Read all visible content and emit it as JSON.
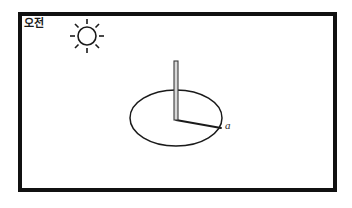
{
  "figure": {
    "title_label": "오전",
    "shadow_label": "a",
    "background_color": "#ffffff",
    "frame": {
      "name": "outer-frame",
      "color": "#111111",
      "stroke_width": 4,
      "x": 20,
      "y": 14,
      "width": 315,
      "height": 176
    },
    "sun": {
      "name": "sun-icon",
      "center_x": 87,
      "center_y": 36,
      "radius": 9,
      "ray_count": 8,
      "ray_inner": 12,
      "ray_outer": 17,
      "color": "#1a1a1a"
    },
    "sundial": {
      "name": "sundial-dial",
      "ellipse_cx": 176,
      "ellipse_cy": 118,
      "ellipse_rx": 46,
      "ellipse_ry": 28,
      "ellipse_color": "#1a1a1a",
      "gnomon_x": 176,
      "gnomon_top_y": 61,
      "gnomon_base_y": 120,
      "gnomon_width": 4,
      "gnomon_color": "#3a3a3a",
      "shadow_start_x": 176,
      "shadow_start_y": 120,
      "shadow_end_x": 221,
      "shadow_end_y": 128,
      "shadow_color": "#1a1a1a"
    }
  }
}
